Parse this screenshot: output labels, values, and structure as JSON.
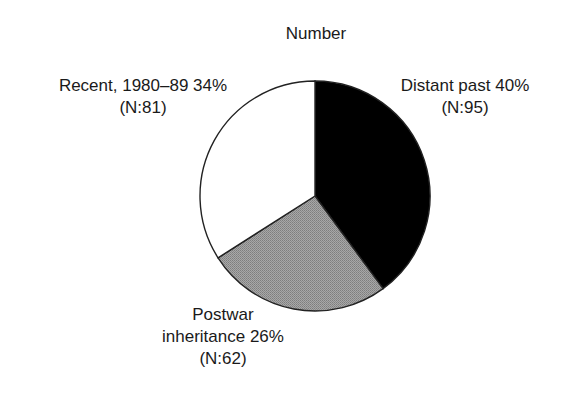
{
  "chart_data": {
    "type": "pie",
    "title": "Number",
    "total": 238,
    "start_angle_deg": 0,
    "direction": "clockwise",
    "slices": [
      {
        "name": "Distant past",
        "value": 95,
        "percent": 40,
        "label_line1": "Distant past 40%",
        "label_line2": "(N:95)",
        "fill": "#000000"
      },
      {
        "name": "Postwar inheritance",
        "value": 62,
        "percent": 26,
        "label_line1": "Postwar",
        "label_line2": "inheritance 26%",
        "label_line3": "(N:62)",
        "fill": "#9a9a9a"
      },
      {
        "name": "Recent, 1980–89",
        "value": 81,
        "percent": 34,
        "label_line1": "Recent, 1980–89 34%",
        "label_line2": "(N:81)",
        "fill": "#ffffff"
      }
    ],
    "legend": "none (labels placed beside slices)"
  },
  "chart": {
    "title": "Number",
    "center": {
      "x": 315,
      "y": 196
    },
    "radius": 115,
    "stroke": "#222222"
  }
}
